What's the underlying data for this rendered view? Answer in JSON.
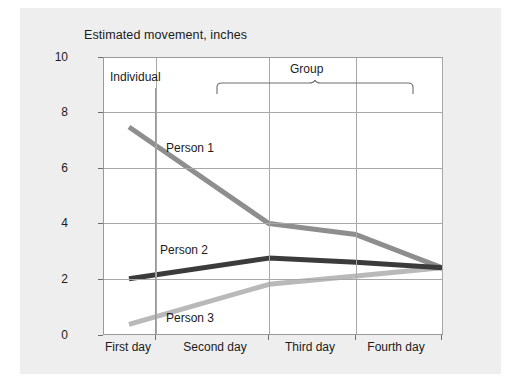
{
  "caption": "Estimated movement, inches",
  "annotations": {
    "individual": "Individual",
    "group": "Group"
  },
  "colors": {
    "person1": "#8e8e8e",
    "person2": "#3b3b3b",
    "person3": "#b9b9b9",
    "grid": "#a8a8a8",
    "axis": "#9a9a9a",
    "page_background": "#eeeeee",
    "plot_background": "#ffffff",
    "text": "#1b1b1b"
  },
  "chart_data": {
    "type": "line",
    "title": "Estimated movement, inches",
    "xlabel": "",
    "ylabel": "Estimated movement, inches",
    "categories": [
      "First day",
      "Second day",
      "Third day",
      "Fourth day"
    ],
    "ylim": [
      0,
      10
    ],
    "yticks": [
      0,
      2,
      4,
      6,
      8,
      10
    ],
    "ytick_labels": [
      "0",
      "2",
      "4",
      "6",
      "8",
      "10"
    ],
    "grid": true,
    "legend": "inline-labels",
    "annotations": [
      {
        "text": "Individual",
        "spans": [
          "First day"
        ]
      },
      {
        "text": "Group",
        "spans": [
          "Second day",
          "Third day",
          "Fourth day"
        ]
      }
    ],
    "series": [
      {
        "name": "Person 1",
        "color": "#8e8e8e",
        "values": [
          7.5,
          4.0,
          3.6,
          2.4
        ]
      },
      {
        "name": "Person 2",
        "color": "#3b3b3b",
        "values": [
          2.0,
          2.75,
          2.6,
          2.4
        ]
      },
      {
        "name": "Person 3",
        "color": "#b9b9b9",
        "values": [
          0.35,
          1.8,
          2.1,
          2.4
        ]
      }
    ]
  }
}
